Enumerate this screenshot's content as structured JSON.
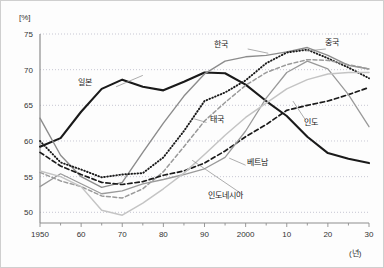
{
  "chart_data": {
    "type": "line",
    "title": "",
    "subtitle": "",
    "xlabel": "(년)",
    "ylabel": "[%]",
    "xlim": [
      1950,
      2030
    ],
    "ylim": [
      48.5,
      75
    ],
    "grid": true,
    "legend_position": "inline-annotations",
    "y_ticks": [
      75,
      70,
      65,
      60,
      55,
      50
    ],
    "x_ticks": [
      1950,
      1960,
      1970,
      1980,
      1990,
      2000,
      2010,
      2020,
      2030
    ],
    "x_tick_labels": [
      "1950",
      "60",
      "70",
      "80",
      "90",
      "2000",
      "10",
      "20",
      "30"
    ],
    "x_minor_ticks": [
      1955,
      1965,
      1975,
      1985,
      1995,
      2005,
      2015,
      2025
    ],
    "x": [
      1950,
      1955,
      1960,
      1965,
      1970,
      1975,
      1980,
      1985,
      1990,
      1995,
      2000,
      2005,
      2010,
      2015,
      2020,
      2025,
      2030
    ],
    "series": [
      {
        "name": "일본",
        "name_en": "Japan",
        "style": "solid",
        "color": "#1a1a1a",
        "width": 2.1,
        "values": [
          59.2,
          60.4,
          64.1,
          67.3,
          68.6,
          67.6,
          67.1,
          68.3,
          69.6,
          69.5,
          67.9,
          65.6,
          63.5,
          60.6,
          58.3,
          57.5,
          56.9
        ]
      },
      {
        "name": "한국",
        "name_en": "Korea",
        "style": "solid",
        "color": "#8c8c8c",
        "width": 1.4,
        "values": [
          63.2,
          58.0,
          55.0,
          53.5,
          54.2,
          58.4,
          62.5,
          66.3,
          69.4,
          71.2,
          71.8,
          72.0,
          72.5,
          73.1,
          72.0,
          70.6,
          70.1
        ]
      },
      {
        "name": "중국",
        "name_en": "China",
        "style": "dotted",
        "color": "#1a1a1a",
        "width": 1.9,
        "values": [
          60.0,
          57.0,
          56.0,
          54.9,
          55.3,
          55.5,
          57.7,
          61.4,
          65.6,
          66.8,
          68.5,
          70.9,
          72.4,
          72.8,
          71.6,
          70.3,
          68.8
        ]
      },
      {
        "name": "태국",
        "name_en": "Thailand",
        "style": "dashed",
        "color": "#9a9a9a",
        "width": 1.5,
        "values": [
          55.6,
          54.4,
          53.6,
          52.3,
          52.0,
          53.3,
          55.7,
          59.2,
          62.8,
          65.4,
          67.8,
          69.6,
          70.7,
          71.4,
          71.3,
          70.7,
          70.1
        ]
      },
      {
        "name": "인도",
        "name_en": "India",
        "style": "dashed",
        "color": "#1a1a1a",
        "width": 1.7,
        "values": [
          58.4,
          56.5,
          55.3,
          54.2,
          53.9,
          54.3,
          55.2,
          55.8,
          56.9,
          58.6,
          60.6,
          62.3,
          64.3,
          65.0,
          65.6,
          66.5,
          67.5
        ]
      },
      {
        "name": "베트남",
        "name_en": "Vietnam",
        "style": "solid",
        "color": "#9a9a9a",
        "width": 1.3,
        "values": [
          53.6,
          55.4,
          54.0,
          52.6,
          53.0,
          54.0,
          54.6,
          55.3,
          56.1,
          57.7,
          61.4,
          66.0,
          69.6,
          71.2,
          70.1,
          66.5,
          62.0
        ]
      },
      {
        "name": "인도네시아",
        "name_en": "Indonesia",
        "style": "solid",
        "color": "#c4c4c4",
        "width": 1.5,
        "values": [
          55.8,
          55.0,
          53.6,
          50.3,
          49.6,
          51.3,
          53.3,
          55.5,
          58.1,
          60.8,
          63.3,
          65.3,
          67.3,
          68.6,
          69.4,
          69.6,
          69.6
        ]
      }
    ],
    "annotations": [
      {
        "text": "일본",
        "x": 1961,
        "y": 67.8
      },
      {
        "text": "한국",
        "x": 1994,
        "y": 73.2
      },
      {
        "text": "중국",
        "x": 2021,
        "y": 73.4
      },
      {
        "text": "태국",
        "x": 1993,
        "y": 62.6
      },
      {
        "text": "인도",
        "x": 2016,
        "y": 62.3
      },
      {
        "text": "베트남",
        "x": 2003,
        "y": 56.7
      },
      {
        "text": "인도네시아",
        "x": 1995,
        "y": 52.0
      }
    ]
  }
}
